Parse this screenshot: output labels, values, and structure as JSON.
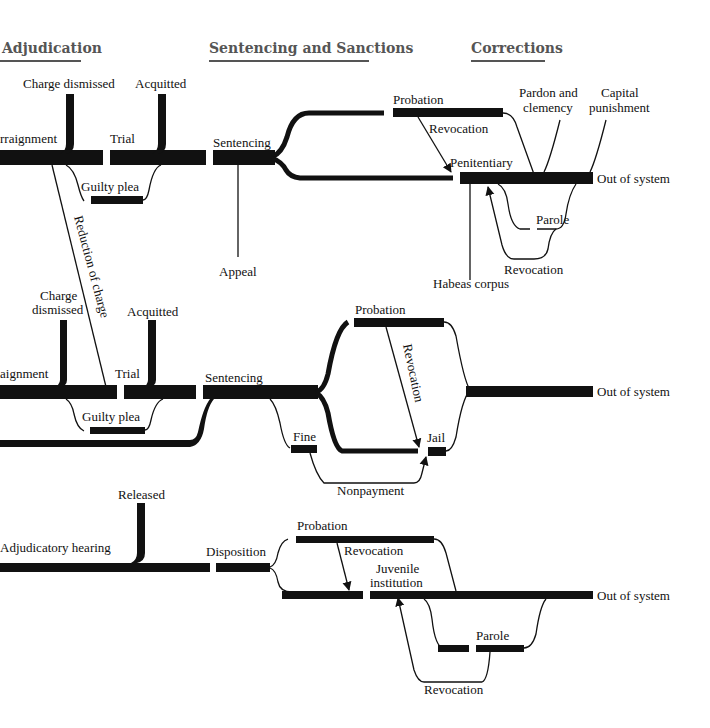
{
  "headers": {
    "adjudication": "Adjudication",
    "sentencing": "Sentencing and Sanctions",
    "corrections": "Corrections"
  },
  "felony_track": {
    "arraignment": "rraignment",
    "charge_dismissed": "Charge dismissed",
    "acquitted": "Acquitted",
    "trial": "Trial",
    "guilty_plea": "Guilty plea",
    "reduction_of_charge": "Reduction of charge",
    "sentencing": "Sentencing",
    "appeal": "Appeal",
    "probation": "Probation",
    "revocation_probation": "Revocation",
    "penitentiary": "Penitentiary",
    "pardon_line1": "Pardon and",
    "pardon_line2": "clemency",
    "capital_line1": "Capital",
    "capital_line2": "punishment",
    "out_of_system": "Out of system",
    "parole": "Parole",
    "revocation_parole": "Revocation",
    "habeas_corpus": "Habeas corpus"
  },
  "misdemeanor_track": {
    "charge_line1": "Charge",
    "charge_line2": "dismissed",
    "acquitted": "Acquitted",
    "arraignment": "aignment",
    "trial": "Trial",
    "guilty_plea": "Guilty plea",
    "sentencing": "Sentencing",
    "probation": "Probation",
    "revocation": "Revocation",
    "fine": "Fine",
    "jail": "Jail",
    "nonpayment": "Nonpayment",
    "out_of_system": "Out of system"
  },
  "juvenile_track": {
    "released": "Released",
    "adjudicatory_hearing": "Adjudicatory hearing",
    "disposition": "Disposition",
    "probation": "Probation",
    "revocation_probation": "Revocation",
    "juvenile_line1": "Juvenile",
    "juvenile_line2": "institution",
    "out_of_system": "Out of system",
    "parole": "Parole",
    "revocation_parole": "Revocation"
  }
}
